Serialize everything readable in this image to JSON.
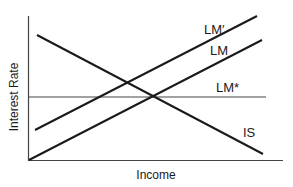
{
  "diagram": {
    "type": "IS-LM",
    "axes": {
      "xlabel": "Income",
      "ylabel": "Interest Rate"
    },
    "curves": [
      {
        "id": "lm_prime",
        "label": "LM′",
        "x1": 35,
        "y1": 130,
        "x2": 257,
        "y2": 16,
        "stroke_width": 2,
        "color": "#1a1a1a"
      },
      {
        "id": "lm",
        "label": "LM",
        "x1": 29,
        "y1": 160,
        "x2": 262,
        "y2": 40,
        "stroke_width": 2,
        "color": "#1a1a1a"
      },
      {
        "id": "lm_star",
        "label": "LM*",
        "x1": 28,
        "y1": 97,
        "x2": 266,
        "y2": 97,
        "stroke_width": 1.2,
        "color": "#444444"
      },
      {
        "id": "is",
        "label": "IS",
        "x1": 37,
        "y1": 35,
        "x2": 263,
        "y2": 154,
        "stroke_width": 2,
        "color": "#1a1a1a"
      }
    ],
    "labels": {
      "lm_prime": "LM′",
      "lm": "LM",
      "lm_star": "LM*",
      "is": "IS",
      "xlabel": "Income",
      "ylabel": "Interest Rate"
    },
    "equilibrium_point": {
      "x": 153,
      "y": 97
    },
    "colors": {
      "line": "#1a1a1a",
      "axis": "#444444",
      "background": "#ffffff"
    }
  }
}
